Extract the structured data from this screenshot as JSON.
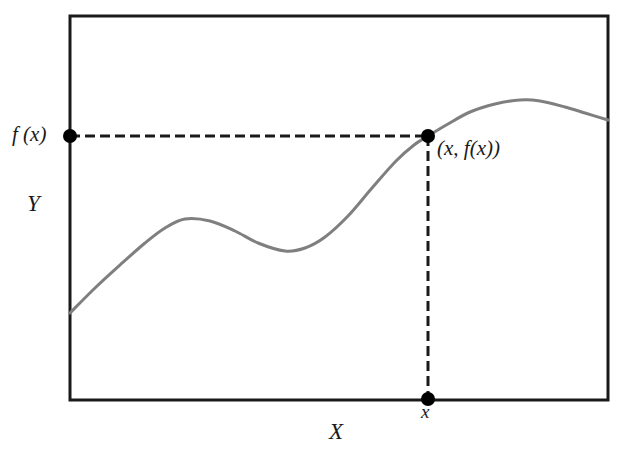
{
  "figure": {
    "title": "",
    "axis_labels": {
      "x": "X",
      "y": "Y"
    },
    "annotations": {
      "y_value": "f (x)",
      "point": "(x, f(x))",
      "x_value": "x"
    },
    "colors": {
      "frame": "#1a1a1a",
      "curve": "#7f7f7f",
      "dashed_line": "#1a1a1a",
      "marker": "#000000",
      "background": "#ffffff"
    },
    "geometry": {
      "frame": {
        "left": 70,
        "top": 16,
        "right": 608,
        "bottom": 400
      },
      "dash_pattern": "10 5",
      "curve_width": 3,
      "frame_width": 3,
      "marker_radius": 7
    }
  },
  "chart_data": {
    "type": "line",
    "title": "",
    "xlabel": "X",
    "ylabel": "Y",
    "grid": false,
    "legend": "none",
    "series": [
      {
        "name": "f(x)",
        "description": "smooth continuous function rising from left, with a local maximum, a local minimum, then rising to the marked point and on to a global maximum before descending slightly",
        "points_px": [
          [
            70,
            313
          ],
          [
            95,
            288
          ],
          [
            120,
            265
          ],
          [
            145,
            243
          ],
          [
            165,
            228
          ],
          [
            185,
            219
          ],
          [
            210,
            221
          ],
          [
            235,
            231
          ],
          [
            258,
            243
          ],
          [
            285,
            251
          ],
          [
            305,
            248
          ],
          [
            325,
            237
          ],
          [
            348,
            216
          ],
          [
            372,
            188
          ],
          [
            396,
            161
          ],
          [
            414,
            145
          ],
          [
            428,
            136
          ],
          [
            448,
            124
          ],
          [
            470,
            112
          ],
          [
            495,
            104
          ],
          [
            520,
            100
          ],
          [
            540,
            101
          ],
          [
            565,
            107
          ],
          [
            585,
            113
          ],
          [
            608,
            120
          ]
        ]
      }
    ],
    "markers": [
      {
        "name": "y-intercept-marker",
        "px": [
          70,
          136
        ],
        "label": "f (x)"
      },
      {
        "name": "function-point-marker",
        "px": [
          428,
          136
        ],
        "label": "(x, f(x))"
      },
      {
        "name": "x-tick-marker",
        "px": [
          428,
          399
        ],
        "label": "x"
      }
    ],
    "guides": [
      {
        "name": "horizontal-dashed-guide",
        "from_px": [
          70,
          136
        ],
        "to_px": [
          428,
          136
        ],
        "style": "dashed"
      },
      {
        "name": "vertical-dashed-guide",
        "from_px": [
          428,
          136
        ],
        "to_px": [
          428,
          399
        ],
        "style": "dashed"
      }
    ]
  }
}
